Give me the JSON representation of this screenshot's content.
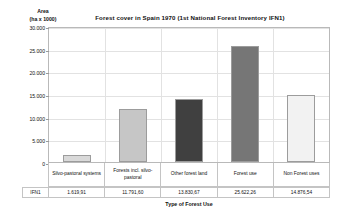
{
  "chart_data": {
    "type": "bar",
    "title": "Forest cover in Spain 1970 (1st National Forest Inventory IFN1)",
    "xlabel": "Type of Forest Use",
    "ylabel": "Area\n(ha x 1000)",
    "ylabel_line1": "Area",
    "ylabel_line2": "(ha x 1000)",
    "categories": [
      "Silvo-pastoral systems",
      "Forests incl. silvo-pastoral",
      "Other forest land",
      "Forest use",
      "Non Forest uses"
    ],
    "series_name": "IFN1",
    "values": [
      1619.91,
      11791.6,
      13830.67,
      25622.26,
      14876.54
    ],
    "value_labels": [
      "1.619,91",
      "11.791,60",
      "13.830,67",
      "25.622,26",
      "14.876,54"
    ],
    "bar_colors": [
      "#d9d9d9",
      "#c6c6c6",
      "#404040",
      "#767676",
      "#f2f2f2"
    ],
    "bar_border_color": "#9c9c9c",
    "ylim": [
      0,
      30000
    ],
    "ytick_values": [
      0,
      5000,
      10000,
      15000,
      20000,
      25000,
      30000
    ],
    "ytick_labels": [
      "0",
      "5.000",
      "10.000",
      "15.000",
      "20.000",
      "25.000",
      "30.000"
    ],
    "grid": true,
    "legend": "none",
    "plot_bg": "#ffffff",
    "grid_color": "#e2e2e2"
  }
}
